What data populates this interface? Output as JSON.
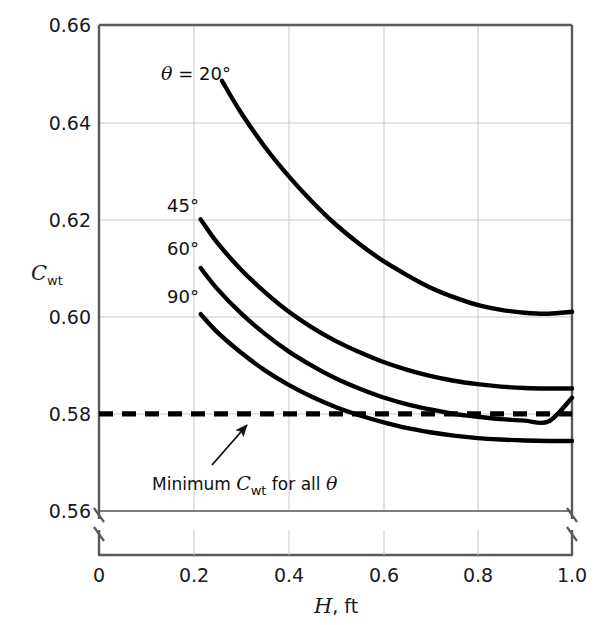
{
  "chart_data": {
    "type": "line",
    "title": "",
    "subtitle": "",
    "xlabel": "H, ft",
    "ylabel": "C_wt",
    "ylabel_base": "C",
    "ylabel_sub": "wt",
    "xlim": [
      0,
      1.0
    ],
    "ylim": [
      0.56,
      0.66
    ],
    "grid": true,
    "legend_position": "inline-curve-labels",
    "axis_break": {
      "x_axis": true,
      "y_axis_low": true,
      "note": "broken axis between baseline and 0.56"
    },
    "xticks": [
      "0",
      "0.2",
      "0.4",
      "0.6",
      "0.8",
      "1.0"
    ],
    "xtick_values": [
      0,
      0.2,
      0.4,
      0.6,
      0.8,
      1.0
    ],
    "yticks": [
      "0.56",
      "0.58",
      "0.60",
      "0.62",
      "0.64",
      "0.66"
    ],
    "ytick_values": [
      0.56,
      0.58,
      0.6,
      0.62,
      0.64,
      0.66
    ],
    "series": [
      {
        "name": "theta = 20 deg",
        "label": "θ = 20°",
        "label_x": 0.32,
        "label_y": 0.6545,
        "style": "solid",
        "x": [
          0.26,
          0.3,
          0.35,
          0.4,
          0.45,
          0.5,
          0.55,
          0.6,
          0.65,
          0.7,
          0.75,
          0.8,
          0.85,
          0.9,
          0.95,
          1.0
        ],
        "y": [
          0.6485,
          0.642,
          0.635,
          0.629,
          0.6237,
          0.619,
          0.615,
          0.6115,
          0.6086,
          0.606,
          0.604,
          0.6024,
          0.6014,
          0.6008,
          0.6006,
          0.601
        ]
      },
      {
        "name": "theta = 45 deg",
        "label": "45°",
        "label_x": 0.175,
        "label_y": 0.6245,
        "style": "solid",
        "x": [
          0.215,
          0.25,
          0.3,
          0.35,
          0.4,
          0.45,
          0.5,
          0.55,
          0.6,
          0.65,
          0.7,
          0.75,
          0.8,
          0.85,
          0.9,
          0.95,
          1.0
        ],
        "y": [
          0.62,
          0.6152,
          0.6097,
          0.6051,
          0.6011,
          0.5978,
          0.595,
          0.5927,
          0.5907,
          0.5891,
          0.5878,
          0.5868,
          0.5861,
          0.5856,
          0.5853,
          0.5852,
          0.5852
        ]
      },
      {
        "name": "theta = 60 deg",
        "label": "60°",
        "label_x": 0.175,
        "label_y": 0.6143,
        "style": "solid",
        "x": [
          0.215,
          0.25,
          0.3,
          0.35,
          0.4,
          0.45,
          0.5,
          0.55,
          0.6,
          0.65,
          0.7,
          0.75,
          0.8,
          0.85,
          0.9,
          0.95,
          1.0
        ],
        "y": [
          0.61,
          0.6057,
          0.6007,
          0.5965,
          0.5929,
          0.5899,
          0.5873,
          0.5852,
          0.5834,
          0.582,
          0.5809,
          0.58,
          0.5794,
          0.5789,
          0.5786,
          0.5784,
          0.5833
        ]
      },
      {
        "name": "theta = 90 deg",
        "label": "90°",
        "label_x": 0.175,
        "label_y": 0.6043,
        "style": "solid",
        "x": [
          0.215,
          0.25,
          0.3,
          0.35,
          0.4,
          0.45,
          0.5,
          0.55,
          0.6,
          0.65,
          0.7,
          0.75,
          0.8,
          0.85,
          0.9,
          0.95,
          1.0
        ],
        "y": [
          0.6005,
          0.5968,
          0.5926,
          0.589,
          0.586,
          0.5835,
          0.5814,
          0.5797,
          0.5783,
          0.5771,
          0.5762,
          0.5755,
          0.575,
          0.5747,
          0.5745,
          0.5744,
          0.5744
        ]
      }
    ],
    "reference_line": {
      "name": "minimum-cwt",
      "value": 0.58,
      "style": "dashed",
      "annotation": "Minimum C_wt for all θ",
      "annotation_parts": {
        "prefix": "Minimum ",
        "symbol": "C",
        "subscript": "wt",
        "suffix": " for all ",
        "theta": "θ"
      },
      "annotation_x": 0.3,
      "annotation_y": 0.5672
    },
    "colors": {
      "curve": "#000000",
      "reference": "#000000",
      "grid": "#c8c8c8",
      "frame": "#555555",
      "text": "#111111",
      "background": "#ffffff"
    }
  }
}
